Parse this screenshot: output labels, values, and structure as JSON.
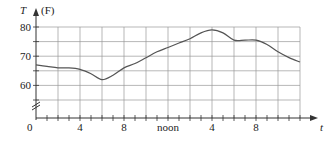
{
  "chart_data": {
    "type": "line",
    "title": "",
    "xlabel": "t",
    "ylabel": "T",
    "y_unit": "(F)",
    "x_tick_labels": [
      {
        "hour": 0,
        "label": "0"
      },
      {
        "hour": 4,
        "label": "4"
      },
      {
        "hour": 8,
        "label": "8"
      },
      {
        "hour": 12,
        "label": "noon"
      },
      {
        "hour": 16,
        "label": "4"
      },
      {
        "hour": 20,
        "label": "8"
      }
    ],
    "y_tick_labels": [
      {
        "value": 60,
        "label": "60"
      },
      {
        "value": 70,
        "label": "70"
      },
      {
        "value": 80,
        "label": "80"
      }
    ],
    "xlim": [
      0,
      24
    ],
    "ylim": [
      50,
      80
    ],
    "y_axis_break": true,
    "grid": {
      "x_step_hours": 2,
      "y_step": 5
    },
    "legend": null,
    "series": [
      {
        "name": "Temperature",
        "x": [
          0,
          1,
          2,
          3,
          4,
          5,
          6,
          7,
          8,
          9,
          10,
          11,
          12,
          13,
          14,
          15,
          16,
          17,
          18,
          19,
          20,
          21,
          22,
          23,
          24
        ],
        "values": [
          67,
          66.5,
          66,
          66,
          65.5,
          64,
          62,
          63.5,
          66,
          67.5,
          69.5,
          71.5,
          73,
          74.5,
          76,
          78,
          79,
          78,
          75.5,
          75.5,
          75.5,
          74,
          71.5,
          69.5,
          68
        ]
      }
    ]
  },
  "labels": {
    "y_axis_name": "T",
    "y_unit": "(F)",
    "x_axis_name": "t",
    "origin": "0"
  }
}
